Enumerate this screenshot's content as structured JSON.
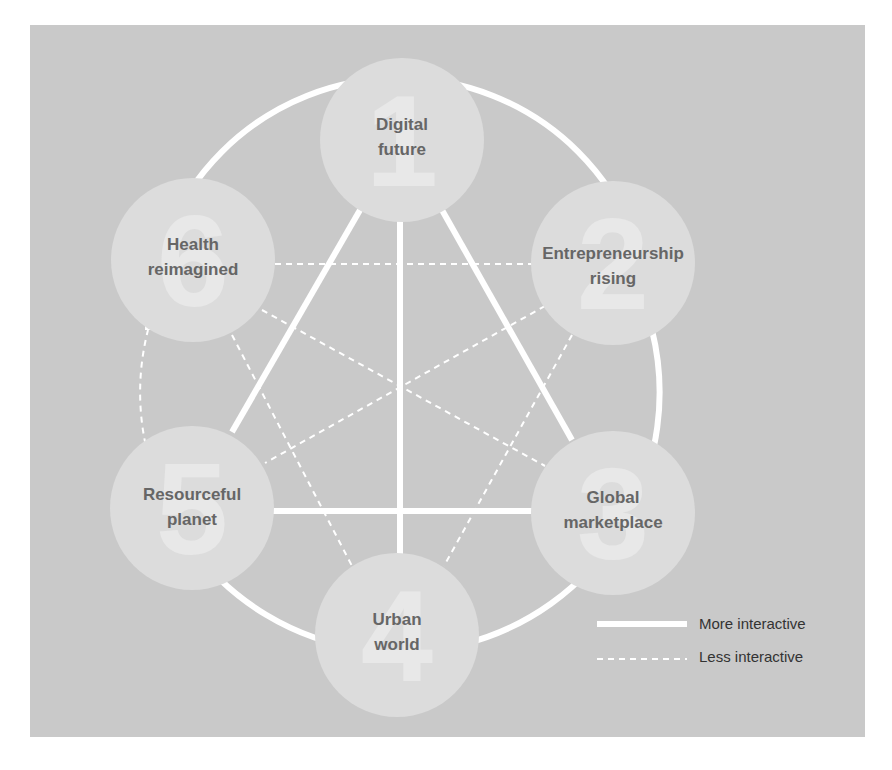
{
  "diagram": {
    "colors": {
      "panel": "#c9c9c9",
      "circle": "#dcdcdc",
      "numeral": "#e8e8e8",
      "label": "#666666",
      "line": "#ffffff"
    },
    "nodes": [
      {
        "id": 1,
        "numeral": "1",
        "line1": "Digital",
        "line2": "future",
        "cx": 402,
        "cy": 140
      },
      {
        "id": 2,
        "numeral": "2",
        "line1": "Entrepreneurship",
        "line2": "rising",
        "cx": 613,
        "cy": 263
      },
      {
        "id": 3,
        "numeral": "3",
        "line1": "Global",
        "line2": "marketplace",
        "cx": 613,
        "cy": 513
      },
      {
        "id": 4,
        "numeral": "4",
        "line1": "Urban",
        "line2": "world",
        "cx": 397,
        "cy": 635
      },
      {
        "id": 5,
        "numeral": "5",
        "line1": "Resourceful",
        "line2": "planet",
        "cx": 192,
        "cy": 508
      },
      {
        "id": 6,
        "numeral": "6",
        "line1": "Health",
        "line2": "reimagined",
        "cx": 193,
        "cy": 260
      }
    ],
    "strong_links": [
      [
        "Digital future",
        "Resourceful planet"
      ],
      [
        "Digital future",
        "Urban world"
      ],
      [
        "Digital future",
        "Global marketplace"
      ],
      [
        "Resourceful planet",
        "Global marketplace"
      ],
      [
        "Digital future",
        "Health reimagined"
      ],
      [
        "Digital future",
        "Entrepreneurship rising"
      ],
      [
        "Entrepreneurship rising",
        "Global marketplace"
      ],
      [
        "Global marketplace",
        "Urban world"
      ],
      [
        "Urban world",
        "Resourceful planet"
      ]
    ],
    "weak_links": [
      [
        "Health reimagined",
        "Entrepreneurship rising"
      ],
      [
        "Health reimagined",
        "Global marketplace"
      ],
      [
        "Health reimagined",
        "Urban world"
      ],
      [
        "Health reimagined",
        "Resourceful planet"
      ],
      [
        "Entrepreneurship rising",
        "Resourceful planet"
      ],
      [
        "Entrepreneurship rising",
        "Urban world"
      ]
    ]
  },
  "legend": {
    "more": "More interactive",
    "less": "Less interactive"
  }
}
